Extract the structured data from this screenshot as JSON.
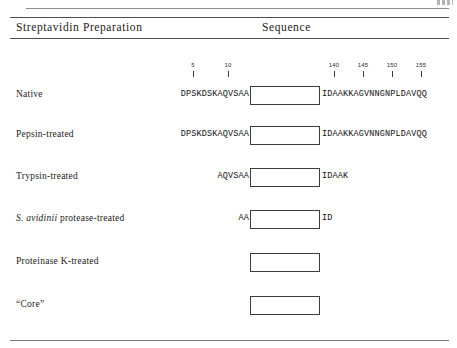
{
  "table": {
    "columns": {
      "preparation": "Streptavidin Preparation",
      "sequence": "Sequence"
    },
    "scale": {
      "ticks": [
        {
          "label": "5",
          "x": 193
        },
        {
          "label": "10",
          "x": 228
        },
        {
          "label": "140",
          "x": 334
        },
        {
          "label": "145",
          "x": 363
        },
        {
          "label": "150",
          "x": 392
        },
        {
          "label": "155",
          "x": 421
        }
      ]
    },
    "rows": [
      {
        "label": "Native",
        "label_italic_prefix": "",
        "n_terminal": "DPSKDSKAQVSAA",
        "core_box": true,
        "c_terminal": "IDAAKKAGVNNGNPLDAVQQ",
        "top": 85
      },
      {
        "label": "Pepsin-treated",
        "label_italic_prefix": "",
        "n_terminal": "DPSKDSKAQVSAA",
        "core_box": true,
        "c_terminal": "IDAAKKAGVNNGNPLDAVQQ",
        "top": 125
      },
      {
        "label": "Trypsin-treated",
        "label_italic_prefix": "",
        "n_terminal": "AQVSAA",
        "core_box": true,
        "c_terminal": "IDAAK",
        "top": 167
      },
      {
        "label": " protease-treated",
        "label_italic_prefix": "S. avidinii",
        "n_terminal": "AA",
        "core_box": true,
        "c_terminal": "ID",
        "top": 209
      },
      {
        "label": "Proteinase K-treated",
        "label_italic_prefix": "",
        "n_terminal": "",
        "core_box": true,
        "c_terminal": "",
        "top": 252
      },
      {
        "label": "“Core”",
        "label_italic_prefix": "",
        "n_terminal": "",
        "core_box": true,
        "c_terminal": "",
        "top": 295
      }
    ]
  },
  "colors": {
    "rule": "#4d4d4d",
    "box_border": "#3c3c3c",
    "text": "#1a1a1a",
    "page_background": "#ffffff"
  }
}
